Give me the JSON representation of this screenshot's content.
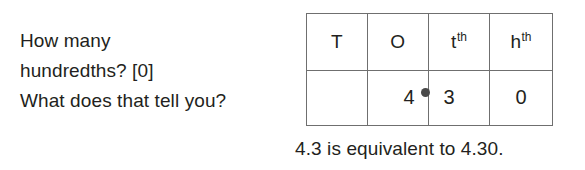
{
  "question": {
    "lines": [
      "How many",
      "hundredths? [0]",
      "What does that tell you?"
    ]
  },
  "table": {
    "headers": [
      {
        "base": "T",
        "sup": ""
      },
      {
        "base": "O",
        "sup": ""
      },
      {
        "base": "t",
        "sup": "th"
      },
      {
        "base": "h",
        "sup": "th"
      }
    ],
    "row": [
      {
        "value": ""
      },
      {
        "value": "4"
      },
      {
        "value": "3"
      },
      {
        "value": "0"
      }
    ],
    "decimal_point_after_column": 2
  },
  "caption": {
    "text": "4.3 is equivalent to 4.30."
  },
  "colors": {
    "text": "#231f20",
    "rule": "#6f6f6f",
    "dot": "#4a4a4a",
    "background": "#ffffff"
  }
}
